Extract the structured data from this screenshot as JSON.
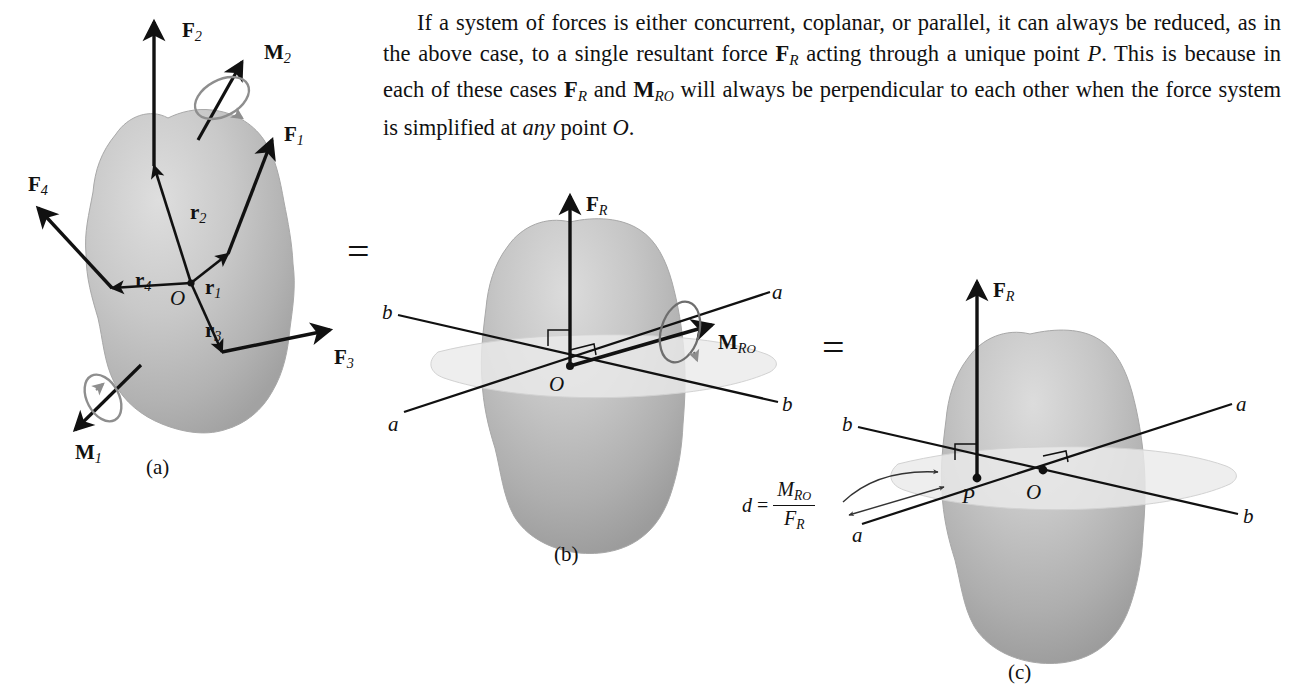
{
  "paragraph": {
    "line1": "If a system of forces is either concurrent, coplanar, or parallel, it can",
    "line2_a": "always be reduced, as in the above case, to a single resultant force ",
    "line2_F": "F",
    "line2_Fsub": "R",
    "line3_a": "acting through a unique point ",
    "line3_P": "P",
    "line3_b": ". This is because in each of these cases",
    "line4_F": "F",
    "line4_Fsub": "R",
    "line4_and": " and ",
    "line4_M": "M",
    "line4_Msub": "R",
    "line4_Msub2": "O",
    "line4_rest": " will always be perpendicular to each other when the force",
    "line5_a": "system is simplified at ",
    "line5_any": "any",
    "line5_b": " point ",
    "line5_O": "O",
    "line5_c": "."
  },
  "equals": {
    "first": "=",
    "second": "="
  },
  "captions": {
    "a": "(a)",
    "b": "(b)",
    "c": "(c)"
  },
  "figure_a": {
    "title": "rigid body with four forces and two couple moments",
    "forces": [
      {
        "name": "F1",
        "base": "F",
        "sub": "1"
      },
      {
        "name": "F2",
        "base": "F",
        "sub": "2"
      },
      {
        "name": "F3",
        "base": "F",
        "sub": "3"
      },
      {
        "name": "F4",
        "base": "F",
        "sub": "4"
      }
    ],
    "moments": [
      {
        "name": "M1",
        "base": "M",
        "sub": "1"
      },
      {
        "name": "M2",
        "base": "M",
        "sub": "2"
      }
    ],
    "position_vectors": [
      {
        "name": "r1",
        "base": "r",
        "sub": "1"
      },
      {
        "name": "r2",
        "base": "r",
        "sub": "2"
      },
      {
        "name": "r3",
        "base": "r",
        "sub": "3"
      },
      {
        "name": "r4",
        "base": "r",
        "sub": "4"
      }
    ],
    "origin_label": "O"
  },
  "figure_b": {
    "resultant_force": {
      "base": "F",
      "sub": "R"
    },
    "resultant_moment": {
      "base": "M",
      "sub": "R",
      "sub2": "O"
    },
    "origin_label": "O",
    "axis_labels": [
      "a",
      "a",
      "b",
      "b"
    ]
  },
  "figure_c": {
    "resultant_force": {
      "base": "F",
      "sub": "R"
    },
    "point_label": "P",
    "origin_label": "O",
    "axis_labels": [
      "a",
      "a",
      "b",
      "b"
    ],
    "distance_formula": {
      "d": "d",
      "equals": "=",
      "numerator_base": "M",
      "numerator_sub": "R",
      "numerator_sub2": "O",
      "denominator_base": "F",
      "denominator_sub": "R"
    },
    "leader_label": "a"
  },
  "colors": {
    "ink": "#111111",
    "body_light": "#d8d8d8",
    "body_mid": "#b6b6b6",
    "body_dark": "#9a9a9a",
    "plane": "#e8e8e8",
    "couple_arc": "#8e8e8e",
    "background": "#ffffff"
  }
}
